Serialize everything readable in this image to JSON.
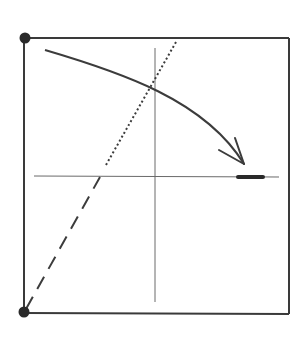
{
  "diagram": {
    "colors": {
      "frame": "#3a3a3a",
      "axes": "#6a6a6a",
      "arrow": "#3c3c3c",
      "dotted_line": "#3c3c3c",
      "dashed_line": "#3c3c3c",
      "corner_dots": "#2a2a2a",
      "highlight_segment": "#2a2a2a",
      "background": "#ffffff"
    },
    "elements": {
      "frame": "square-frame",
      "corner_dots": [
        "top-left",
        "bottom-left"
      ],
      "axes": [
        "vertical-axis",
        "horizontal-axis"
      ],
      "arrow": "curved-arrow",
      "dotted_line": "dotted-line",
      "dashed_line": "dashed-line",
      "segment": "thick-segment-on-horizontal-axis"
    }
  }
}
